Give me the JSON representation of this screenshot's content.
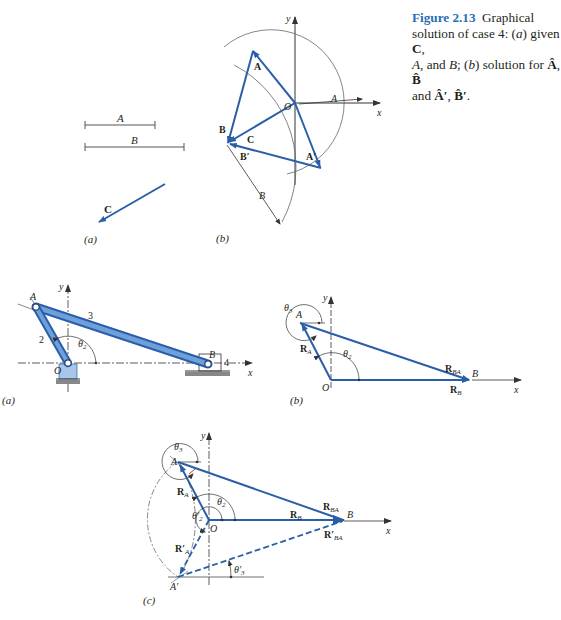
{
  "caption": {
    "figure_number": "Figure 2.13",
    "text_line1": "Graphical",
    "text_line2a": "solution of case 4: (",
    "text_line2b": "a",
    "text_line2c": ") given ",
    "text_line2d": "C",
    "text_line2e": ",",
    "text_line3a": "A",
    "text_line3b": ", and ",
    "text_line3c": "B",
    "text_line3d": "; (",
    "text_line3e": "b",
    "text_line3f": ") solution for ",
    "text_line3g": "Â",
    "text_line3h": ", ",
    "text_line3i": "B̂",
    "text_line4a": "and ",
    "text_line4b": "Â′",
    "text_line4c": ", ",
    "text_line4d": "B̂′",
    "text_line4e": "."
  },
  "figure_2_13": {
    "panel_a": {
      "label": "(a)",
      "segment_A_label": "A",
      "segment_B_label": "B",
      "vector_C_label": "C"
    },
    "panel_b": {
      "label": "(b)",
      "axis_x": "x",
      "axis_y": "y",
      "origin": "O",
      "radius_A_label": "A",
      "radius_B_label": "B",
      "vec_A": "A",
      "vec_B": "B",
      "vec_C": "C",
      "vec_A_prime": "A′",
      "vec_B_prime": "B′"
    }
  },
  "linkage_figure": {
    "panel_a": {
      "label": "(a)",
      "axis_x": "x",
      "axis_y": "y",
      "point_A": "A",
      "point_B": "B",
      "origin": "O",
      "link_2": "2",
      "link_3": "3",
      "link_4": "4",
      "angle_theta2": "θ",
      "angle_theta2_sub": "2"
    },
    "panel_b": {
      "label": "(b)",
      "axis_x": "x",
      "axis_y": "y",
      "point_A": "A",
      "point_B": "B",
      "origin": "O",
      "vec_RA": "R",
      "vec_RA_sub": "A",
      "vec_RBA": "R",
      "vec_RBA_sub": "BA",
      "vec_RB": "R",
      "vec_RB_sub": "B",
      "angle_theta3": "θ",
      "angle_theta3_sub": "3",
      "angle_theta2": "θ",
      "angle_theta2_sub": "2"
    },
    "panel_c": {
      "label": "(c)",
      "axis_x": "x",
      "axis_y": "y",
      "point_A": "A",
      "point_A_prime": "A′",
      "point_B": "B",
      "origin": "O",
      "vec_RA": "R",
      "vec_RA_sub": "A",
      "vec_RA_prime": "R′",
      "vec_RA_prime_sub": "A",
      "vec_RBA": "R",
      "vec_RBA_sub": "BA",
      "vec_RBA_prime": "R′",
      "vec_RBA_prime_sub": "BA",
      "vec_RB": "R",
      "vec_RB_sub": "B",
      "angle_theta3": "θ",
      "angle_theta3_sub": "3",
      "angle_theta2": "θ",
      "angle_theta2_sub": "2",
      "angle_theta2_prime": "θ′",
      "angle_theta2_prime_sub": "2",
      "angle_theta3_prime": "θ′",
      "angle_theta3_prime_sub": "3"
    }
  },
  "colors": {
    "vector_blue": "#2a5fa8",
    "link_blue": "#5b8fd0",
    "link_blue_dark": "#2a5fa8",
    "caption_accent": "#2a6db5",
    "line_gray": "#555555",
    "accent_red": "#c0392b"
  }
}
